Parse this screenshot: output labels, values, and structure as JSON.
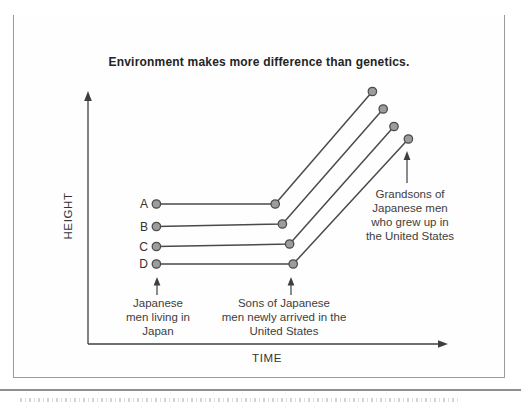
{
  "figure": {
    "label": "Figure 2.1",
    "title": "Japanese Heritability"
  },
  "chart_data": {
    "type": "line",
    "title": "Environment makes more difference than genetics.",
    "xlabel": "TIME",
    "ylabel": "HEIGHT",
    "x_categories": [
      "Japanese men living in Japan",
      "Sons of Japanese men newly arrived in the United States",
      "Grandsons of Japanese men who grew up in the United States"
    ],
    "axis_ranges": {
      "x": [
        0,
        100
      ],
      "y": [
        0,
        100
      ]
    },
    "grid": false,
    "legend": "series letters A–D printed at left end of each line",
    "series": [
      {
        "name": "A",
        "points": [
          [
            19,
            56
          ],
          [
            52,
            56
          ],
          [
            79,
            101
          ]
        ]
      },
      {
        "name": "B",
        "points": [
          [
            19,
            47
          ],
          [
            54,
            48
          ],
          [
            82,
            94
          ]
        ]
      },
      {
        "name": "C",
        "points": [
          [
            19,
            39
          ],
          [
            56,
            40
          ],
          [
            85,
            87
          ]
        ]
      },
      {
        "name": "D",
        "points": [
          [
            19,
            32
          ],
          [
            57,
            32
          ],
          [
            89,
            82
          ]
        ]
      }
    ]
  },
  "annotations": {
    "left": "Japanese\nmen living in\nJapan",
    "middle": "Sons of Japanese\nmen newly arrived in the\nUnited States",
    "right": "Grandsons of\nJapanese men\nwho grew up in\nthe United States"
  }
}
